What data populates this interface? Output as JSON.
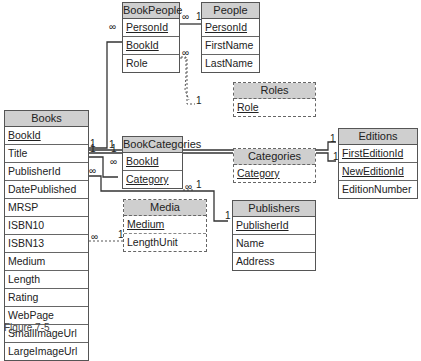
{
  "tables": {
    "books": {
      "title": "Books",
      "fields": [
        "BookId",
        "Title",
        "PublisherId",
        "DatePublished",
        "MRSP",
        "ISBN10",
        "ISBN13",
        "Medium",
        "Length",
        "Rating",
        "WebPage",
        "SmallImageUrl",
        "LargeImageUrl"
      ],
      "primary_keys": [
        "BookId"
      ]
    },
    "book_people": {
      "title": "BookPeople",
      "fields": [
        "PersonId",
        "BookId",
        "Role"
      ],
      "primary_keys": [
        "PersonId",
        "BookId"
      ]
    },
    "people": {
      "title": "People",
      "fields": [
        "PersonId",
        "FirstName",
        "LastName"
      ],
      "primary_keys": [
        "PersonId"
      ]
    },
    "roles": {
      "title": "Roles",
      "fields": [
        "Role"
      ],
      "primary_keys": [
        "Role"
      ],
      "style": "dashed"
    },
    "editions": {
      "title": "Editions",
      "fields": [
        "FirstEditionId",
        "NewEditionId",
        "EditionNumber"
      ],
      "primary_keys": [
        "FirstEditionId",
        "NewEditionId"
      ]
    },
    "book_categories": {
      "title": "BookCategories",
      "fields": [
        "BookId",
        "Category"
      ],
      "primary_keys": [
        "BookId",
        "Category"
      ]
    },
    "categories": {
      "title": "Categories",
      "fields": [
        "Category"
      ],
      "primary_keys": [
        "Category"
      ],
      "style": "dashed"
    },
    "media": {
      "title": "Media",
      "fields": [
        "Medium",
        "LengthUnit"
      ],
      "primary_keys": [
        "Medium"
      ],
      "style": "dashed"
    },
    "publishers": {
      "title": "Publishers",
      "fields": [
        "PublisherId",
        "Name",
        "Address"
      ],
      "primary_keys": [
        "PublisherId"
      ]
    }
  },
  "relationships": [
    {
      "from": "Books.BookId",
      "to": "BookPeople.BookId",
      "from_card": "1",
      "to_card": "∞"
    },
    {
      "from": "People.PersonId",
      "to": "BookPeople.PersonId",
      "from_card": "1",
      "to_card": "∞"
    },
    {
      "from": "Roles.Role",
      "to": "BookPeople.Role",
      "from_card": "1",
      "to_card": "∞"
    },
    {
      "from": "Books.BookId",
      "to": "Editions.FirstEditionId",
      "from_card": "1",
      "to_card": "1"
    },
    {
      "from": "Books.BookId",
      "to": "Editions.NewEditionId",
      "from_card": "1",
      "to_card": "1"
    },
    {
      "from": "Books.BookId",
      "to": "BookCategories.BookId",
      "from_card": "1",
      "to_card": "∞"
    },
    {
      "from": "Categories.Category",
      "to": "BookCategories.Category",
      "from_card": "1",
      "to_card": "∞"
    },
    {
      "from": "Publishers.PublisherId",
      "to": "Books.PublisherId",
      "from_card": "1",
      "to_card": "∞"
    },
    {
      "from": "Media.Medium",
      "to": "Books.Medium",
      "from_card": "1",
      "to_card": "∞"
    }
  ],
  "labels": {
    "one": "1",
    "many": "∞"
  },
  "caption": "Figure 7-5"
}
